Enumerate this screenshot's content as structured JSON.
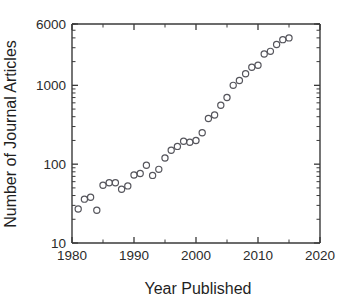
{
  "figure": {
    "title": "",
    "background_color": "#ffffff",
    "marker_color": "#55555c",
    "axis_color": "#3a3a3a"
  },
  "axes": {
    "x_title": "Year Published",
    "y_title": "Number of Journal Articles",
    "x_tick_labels": [
      "1980",
      "1990",
      "2000",
      "2010",
      "2020"
    ],
    "y_tick_labels": [
      "10",
      "100",
      "1000",
      "6000"
    ]
  },
  "chart_data": {
    "type": "scatter",
    "title": "",
    "xlabel": "Year Published",
    "ylabel": "Number of Journal Articles",
    "xlim": [
      1980,
      2020
    ],
    "ylim": [
      10,
      6000
    ],
    "yscale": "log",
    "xscale": "linear",
    "grid": false,
    "legend": null,
    "x_ticks": [
      1980,
      1990,
      2000,
      2010,
      2020
    ],
    "x_minor_ticks": [
      1985,
      1995,
      2005,
      2015
    ],
    "y_ticks": [
      10,
      100,
      1000,
      6000
    ],
    "marker": "open-circle",
    "x": [
      1981,
      1982,
      1983,
      1984,
      1985,
      1986,
      1987,
      1988,
      1989,
      1990,
      1991,
      1992,
      1993,
      1994,
      1995,
      1996,
      1997,
      1998,
      1999,
      2000,
      2001,
      2002,
      2003,
      2004,
      2005,
      2006,
      2007,
      2008,
      2009,
      2010,
      2011,
      2012,
      2013,
      2014,
      2015
    ],
    "y": [
      27,
      36,
      38,
      26,
      54,
      58,
      58,
      48,
      53,
      73,
      76,
      97,
      72,
      86,
      120,
      150,
      168,
      195,
      190,
      200,
      250,
      380,
      420,
      560,
      700,
      1000,
      1150,
      1400,
      1700,
      1800,
      2500,
      2700,
      3300,
      3800,
      4000
    ],
    "series": [
      {
        "name": "Journal articles per year",
        "points": [
          {
            "x": 1981,
            "y": 27
          },
          {
            "x": 1982,
            "y": 36
          },
          {
            "x": 1983,
            "y": 38
          },
          {
            "x": 1984,
            "y": 26
          },
          {
            "x": 1985,
            "y": 54
          },
          {
            "x": 1986,
            "y": 58
          },
          {
            "x": 1987,
            "y": 58
          },
          {
            "x": 1988,
            "y": 48
          },
          {
            "x": 1989,
            "y": 53
          },
          {
            "x": 1990,
            "y": 73
          },
          {
            "x": 1991,
            "y": 76
          },
          {
            "x": 1992,
            "y": 97
          },
          {
            "x": 1993,
            "y": 72
          },
          {
            "x": 1994,
            "y": 86
          },
          {
            "x": 1995,
            "y": 120
          },
          {
            "x": 1996,
            "y": 150
          },
          {
            "x": 1997,
            "y": 168
          },
          {
            "x": 1998,
            "y": 195
          },
          {
            "x": 1999,
            "y": 190
          },
          {
            "x": 2000,
            "y": 200
          },
          {
            "x": 2001,
            "y": 250
          },
          {
            "x": 2002,
            "y": 380
          },
          {
            "x": 2003,
            "y": 420
          },
          {
            "x": 2004,
            "y": 560
          },
          {
            "x": 2005,
            "y": 700
          },
          {
            "x": 2006,
            "y": 1000
          },
          {
            "x": 2007,
            "y": 1150
          },
          {
            "x": 2008,
            "y": 1400
          },
          {
            "x": 2009,
            "y": 1700
          },
          {
            "x": 2010,
            "y": 1800
          },
          {
            "x": 2011,
            "y": 2500
          },
          {
            "x": 2012,
            "y": 2700
          },
          {
            "x": 2013,
            "y": 3300
          },
          {
            "x": 2014,
            "y": 3800
          },
          {
            "x": 2015,
            "y": 4000
          }
        ]
      }
    ]
  }
}
